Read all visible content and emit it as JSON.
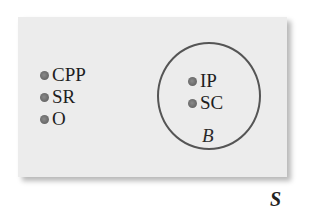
{
  "diagram": {
    "type": "venn",
    "universe": {
      "label": "S",
      "fill_color": "#ececec"
    },
    "sets": [
      {
        "label": "B",
        "border_color": "#555555",
        "elements": [
          "IP",
          "SC"
        ]
      }
    ],
    "outside_elements": [
      "CPP",
      "SR",
      "O"
    ],
    "dot_color": "#707070"
  }
}
